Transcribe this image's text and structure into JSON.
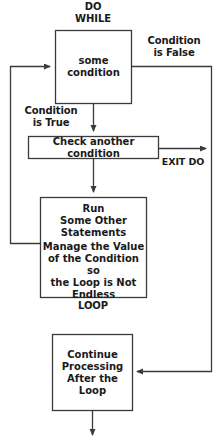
{
  "diagram": {
    "title_hidden": "Do While loop flowchart",
    "colors": {
      "stroke": "#3b3b3b",
      "text": "#1a1a1a",
      "background": "#ffffff"
    },
    "labels": {
      "do_while": "DO\nWHILE",
      "condition_false": "Condition\nis False",
      "condition_true": "Condition\nis True",
      "exit_do": "EXIT DO",
      "loop": "LOOP"
    },
    "boxes": {
      "some_condition": "some\ncondition",
      "check_another_condition": "Check another condition",
      "run_statements_top": "Run\nSome Other\nStatements",
      "run_statements_bottom": "Manage the Value\nof the Condition so\nthe Loop is Not\nEndless",
      "continue_processing": "Continue\nProcessing\nAfter the\nLoop"
    }
  }
}
